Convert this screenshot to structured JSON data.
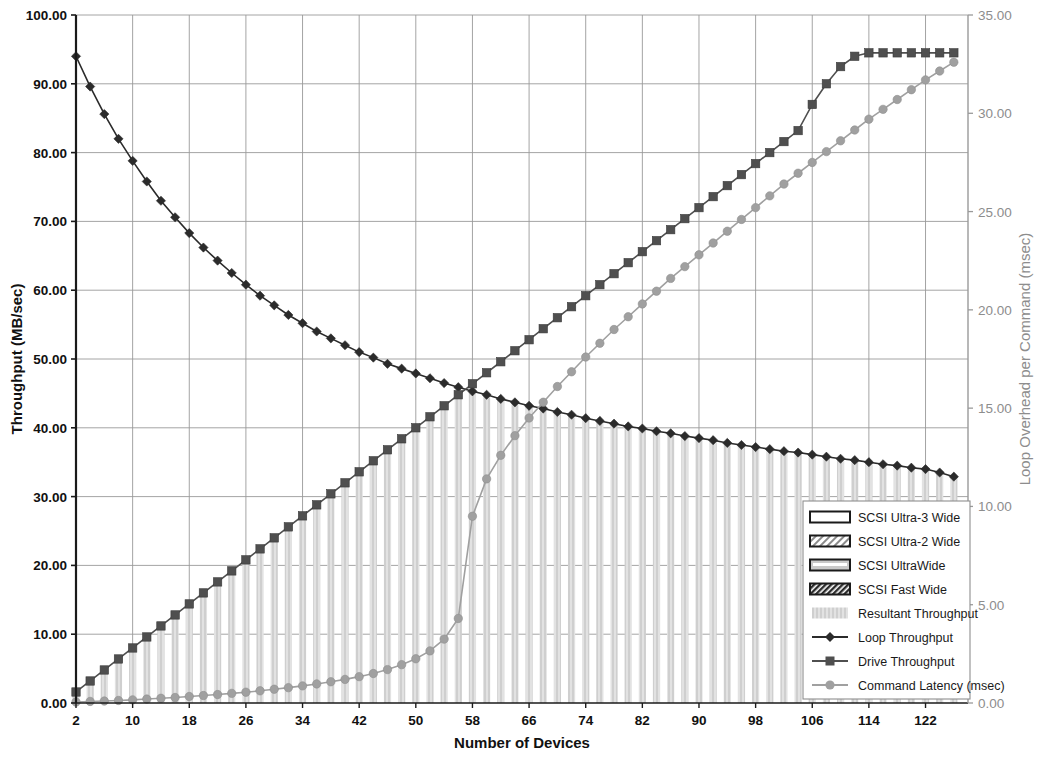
{
  "chart_data": {
    "type": "line",
    "title": "",
    "xlabel": "Number of Devices",
    "ylabel": "Throughput (MB/sec)",
    "y2label": "Loop Overhead per Command (msec)",
    "xlim": [
      2,
      128
    ],
    "ylim": [
      0,
      100
    ],
    "y2lim": [
      0,
      35
    ],
    "grid": true,
    "legend_position": "bottom-right",
    "xticks": [
      2,
      10,
      18,
      26,
      34,
      42,
      50,
      58,
      66,
      74,
      82,
      90,
      98,
      106,
      114,
      122
    ],
    "xtick_labels": [
      "2",
      "10",
      "18",
      "26",
      "34",
      "42",
      "50",
      "58",
      "66",
      "74",
      "82",
      "90",
      "98",
      "106",
      "114",
      "122"
    ],
    "yticks": [
      0,
      10,
      20,
      30,
      40,
      50,
      60,
      70,
      80,
      90,
      100
    ],
    "ytick_labels": [
      "0.00",
      "10.00",
      "20.00",
      "30.00",
      "40.00",
      "50.00",
      "60.00",
      "70.00",
      "80.00",
      "90.00",
      "100.00"
    ],
    "y2ticks": [
      0,
      5,
      10,
      15,
      20,
      25,
      30,
      35
    ],
    "y2tick_labels": [
      "0.00",
      "5.00",
      "10.00",
      "15.00",
      "20.00",
      "25.00",
      "30.00",
      "35.00"
    ],
    "x": [
      2,
      4,
      6,
      8,
      10,
      12,
      14,
      16,
      18,
      20,
      22,
      24,
      26,
      28,
      30,
      32,
      34,
      36,
      38,
      40,
      42,
      44,
      46,
      48,
      50,
      52,
      54,
      56,
      58,
      60,
      62,
      64,
      66,
      68,
      70,
      72,
      74,
      76,
      78,
      80,
      82,
      84,
      86,
      88,
      90,
      92,
      94,
      96,
      98,
      100,
      102,
      104,
      106,
      108,
      110,
      112,
      114,
      116,
      118,
      120,
      122,
      124,
      126
    ],
    "series": [
      {
        "name": "Loop Throughput",
        "axis": "left",
        "marker": "diamond",
        "color": "#2b2b2b",
        "values": [
          94.0,
          89.6,
          85.6,
          82.0,
          78.8,
          75.8,
          73.0,
          70.6,
          68.3,
          66.2,
          64.3,
          62.5,
          60.8,
          59.2,
          57.8,
          56.4,
          55.2,
          54.0,
          53.0,
          52.0,
          51.0,
          50.2,
          49.3,
          48.6,
          47.9,
          47.2,
          46.5,
          45.9,
          45.3,
          44.8,
          44.2,
          43.7,
          43.2,
          42.8,
          42.3,
          41.9,
          41.4,
          41.0,
          40.6,
          40.2,
          39.9,
          39.5,
          39.2,
          38.8,
          38.5,
          38.2,
          37.8,
          37.5,
          37.2,
          36.9,
          36.6,
          36.4,
          36.1,
          35.8,
          35.5,
          35.3,
          35.0,
          34.7,
          34.5,
          34.2,
          34.0,
          33.5,
          32.9
        ]
      },
      {
        "name": "Drive Throughput",
        "axis": "left",
        "marker": "square",
        "color": "#4f4f4f",
        "values": [
          1.6,
          3.2,
          4.8,
          6.4,
          8.0,
          9.6,
          11.2,
          12.8,
          14.4,
          16.0,
          17.6,
          19.2,
          20.8,
          22.4,
          24.0,
          25.6,
          27.2,
          28.8,
          30.4,
          32.0,
          33.6,
          35.2,
          36.8,
          38.4,
          40.0,
          41.6,
          43.2,
          44.8,
          46.4,
          48.0,
          49.6,
          51.2,
          52.8,
          54.4,
          56.0,
          57.6,
          59.2,
          60.8,
          62.4,
          64.0,
          65.6,
          67.2,
          68.8,
          70.4,
          72.0,
          73.6,
          75.2,
          76.8,
          78.4,
          80.0,
          81.6,
          83.2,
          87.0,
          90.0,
          92.5,
          94.0,
          94.5,
          94.5,
          94.5,
          94.5,
          94.5,
          94.5,
          94.5
        ]
      },
      {
        "name": "Command Latency (msec)",
        "axis": "right",
        "marker": "circle",
        "color": "#a0a0a0",
        "values": [
          0.05,
          0.08,
          0.1,
          0.13,
          0.16,
          0.2,
          0.24,
          0.28,
          0.33,
          0.38,
          0.43,
          0.49,
          0.55,
          0.62,
          0.7,
          0.78,
          0.87,
          0.97,
          1.08,
          1.2,
          1.34,
          1.5,
          1.7,
          1.95,
          2.25,
          2.65,
          3.25,
          4.3,
          9.5,
          11.4,
          12.6,
          13.6,
          14.5,
          15.3,
          16.1,
          16.85,
          17.6,
          18.3,
          19.0,
          19.65,
          20.3,
          20.95,
          21.6,
          22.2,
          22.8,
          23.4,
          24.0,
          24.6,
          25.2,
          25.8,
          26.4,
          26.95,
          27.5,
          28.05,
          28.6,
          29.15,
          29.7,
          30.2,
          30.7,
          31.2,
          31.7,
          32.15,
          32.6
        ]
      },
      {
        "name": "Resultant Throughput",
        "axis": "left",
        "type": "bar",
        "color": "#d9d9d9",
        "values": [
          1.6,
          3.2,
          4.8,
          6.4,
          8.0,
          9.6,
          11.2,
          12.8,
          14.4,
          16.0,
          17.6,
          19.2,
          20.8,
          22.4,
          24.0,
          25.6,
          27.2,
          28.8,
          30.4,
          32.0,
          33.6,
          35.2,
          36.8,
          38.4,
          40.0,
          41.6,
          43.2,
          44.8,
          45.3,
          44.8,
          44.2,
          43.7,
          43.2,
          42.8,
          42.3,
          41.9,
          41.4,
          41.0,
          40.6,
          40.2,
          39.9,
          39.5,
          39.2,
          38.8,
          38.5,
          38.2,
          37.8,
          37.5,
          37.2,
          36.9,
          36.6,
          36.4,
          36.1,
          35.8,
          35.5,
          35.3,
          35.0,
          34.7,
          34.5,
          34.2,
          34.0,
          33.5,
          32.9
        ]
      }
    ],
    "legend": [
      {
        "label": "SCSI Ultra-3 Wide",
        "swatch": "empty"
      },
      {
        "label": "SCSI Ultra-2 Wide",
        "swatch": "hatch-light"
      },
      {
        "label": "SCSI UltraWide",
        "swatch": "gray-stripe"
      },
      {
        "label": "SCSI Fast Wide",
        "swatch": "hatch-dark"
      },
      {
        "label": "Resultant Throughput",
        "swatch": "bar-gray"
      },
      {
        "label": "Loop Throughput",
        "swatch": "line-diamond"
      },
      {
        "label": "Drive Throughput",
        "swatch": "line-square"
      },
      {
        "label": "Command Latency (msec)",
        "swatch": "line-circle"
      }
    ],
    "colors": {
      "loop_throughput": "#2b2b2b",
      "drive_throughput": "#4f4f4f",
      "command_latency": "#a0a0a0",
      "resultant_bars": "#d9d9d9",
      "grid": "#9a9a9a",
      "right_axis_text": "#8d8d8d"
    }
  }
}
